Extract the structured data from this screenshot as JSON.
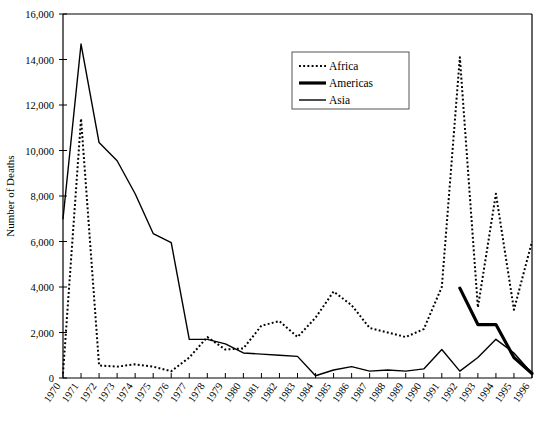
{
  "chart_data": {
    "type": "line",
    "title": "",
    "xlabel": "",
    "ylabel": "Number of Deaths",
    "xlim": [
      1970,
      1996
    ],
    "ylim": [
      0,
      16000
    ],
    "ytick_values": [
      0,
      2000,
      4000,
      6000,
      8000,
      10000,
      12000,
      14000,
      16000
    ],
    "ytick_labels": [
      "0",
      "2,000",
      "4,000",
      "6,000",
      "8,000",
      "10,000",
      "12,000",
      "14,000",
      "16,000"
    ],
    "grid": false,
    "legend_position": "top-center-right",
    "x": [
      1970,
      1971,
      1972,
      1973,
      1974,
      1975,
      1976,
      1977,
      1978,
      1979,
      1980,
      1981,
      1982,
      1983,
      1984,
      1985,
      1986,
      1987,
      1988,
      1989,
      1990,
      1991,
      1992,
      1993,
      1994,
      1995,
      1996
    ],
    "categories": [
      "1970",
      "1971",
      "1972",
      "1973",
      "1974",
      "1975",
      "1976",
      "1977",
      "1978",
      "1979",
      "1980",
      "1981",
      "1982",
      "1983",
      "1984",
      "1985",
      "1986",
      "1987",
      "1988",
      "1989",
      "1990",
      "1991",
      "1992",
      "1993",
      "1994",
      "1995",
      "1996"
    ],
    "series": [
      {
        "name": "Africa",
        "style": "dotted",
        "color": "#000000",
        "width": 2,
        "values": [
          200,
          11400,
          550,
          500,
          600,
          500,
          300,
          900,
          1800,
          1250,
          1300,
          2300,
          2500,
          1800,
          2650,
          3800,
          3200,
          2200,
          2000,
          1800,
          2150,
          4000,
          14100,
          3100,
          8100,
          3000,
          6000
        ]
      },
      {
        "name": "Americas",
        "style": "solid-thick",
        "color": "#000000",
        "width": 3.2,
        "values": [
          null,
          null,
          null,
          null,
          null,
          null,
          null,
          null,
          null,
          null,
          null,
          null,
          null,
          null,
          null,
          null,
          null,
          null,
          null,
          null,
          null,
          null,
          3950,
          2350,
          2350,
          900,
          200
        ]
      },
      {
        "name": "Asia",
        "style": "solid-thin",
        "color": "#000000",
        "width": 1.4,
        "values": [
          7000,
          14680,
          10350,
          9550,
          8100,
          6350,
          5950,
          1700,
          1700,
          1500,
          1100,
          1050,
          1000,
          950,
          100,
          350,
          500,
          300,
          350,
          300,
          400,
          1250,
          300,
          900,
          1700,
          1100,
          200
        ]
      }
    ]
  },
  "legend": {
    "items": [
      {
        "label": "Africa",
        "style": "dotted"
      },
      {
        "label": "Americas",
        "style": "solid-thick"
      },
      {
        "label": "Asia",
        "style": "solid-thin"
      }
    ]
  },
  "axes": {
    "y_title": "Number of Deaths"
  }
}
